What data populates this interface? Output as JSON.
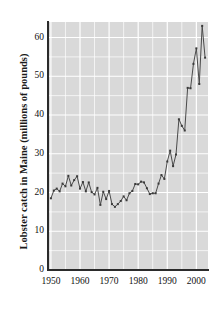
{
  "chart_data": {
    "type": "line",
    "title": "",
    "xlabel": "",
    "ylabel": "Lobster catch in Maine (millions of pounds)",
    "xlim": [
      1949,
      2004
    ],
    "ylim": [
      0,
      64
    ],
    "grid": true,
    "grid_color": "#ffffff",
    "panel_background": "#d9d9d9",
    "line_color": "#4a4a4a",
    "marker_color": "#3a3a3a",
    "legend": null,
    "xticks": [
      "1950",
      "1960",
      "1970",
      "1980",
      "1990",
      "2000"
    ],
    "xtick_values": [
      1950,
      1960,
      1970,
      1980,
      1990,
      2000
    ],
    "yticks": [
      "0",
      "10",
      "20",
      "30",
      "40",
      "50",
      "60"
    ],
    "ytick_values": [
      0,
      10,
      20,
      30,
      40,
      50,
      60
    ],
    "x": [
      1950,
      1951,
      1952,
      1953,
      1954,
      1955,
      1956,
      1957,
      1958,
      1959,
      1960,
      1961,
      1962,
      1963,
      1964,
      1965,
      1966,
      1967,
      1968,
      1969,
      1970,
      1971,
      1972,
      1973,
      1974,
      1975,
      1976,
      1977,
      1978,
      1979,
      1980,
      1981,
      1982,
      1983,
      1984,
      1985,
      1986,
      1987,
      1988,
      1989,
      1990,
      1991,
      1992,
      1993,
      1994,
      1995,
      1996,
      1997,
      1998,
      1999,
      2000,
      2001,
      2002,
      2003
    ],
    "values": [
      18.5,
      20.5,
      21.0,
      20.3,
      22.3,
      21.6,
      24.3,
      21.8,
      23.2,
      24.2,
      21.0,
      22.7,
      20.3,
      22.6,
      20.1,
      19.5,
      21.2,
      16.8,
      20.2,
      18.3,
      20.4,
      17.0,
      16.3,
      17.0,
      17.8,
      19.0,
      18.0,
      19.8,
      20.4,
      22.2,
      22.1,
      22.8,
      22.6,
      21.1,
      19.6,
      19.8,
      19.8,
      22.3,
      24.5,
      23.5,
      28.0,
      30.8,
      26.8,
      29.8,
      38.9,
      37.2,
      36.0,
      47.0,
      46.9,
      53.2,
      57.2,
      48.0,
      63.0,
      54.8
    ],
    "series_label": "Maine lobster catch",
    "units": "millions of pounds",
    "marker": "square",
    "marker_size": 2
  },
  "figure": {
    "background": "#ffffff",
    "axis_color": "#2b2b2b"
  }
}
